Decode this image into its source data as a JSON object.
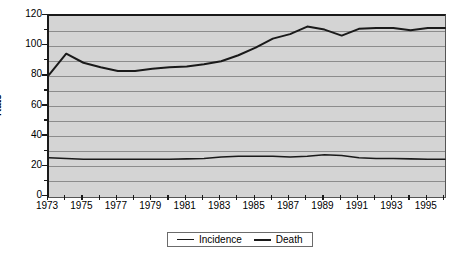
{
  "chart_data": {
    "type": "line",
    "title": "",
    "subtitle": "",
    "xlabel": "",
    "ylabel": "Rate",
    "ylim": [
      0,
      120
    ],
    "xlim": [
      1973,
      1996
    ],
    "ytick_labels": [
      "120",
      "100",
      "80",
      "60",
      "40",
      "20",
      "0"
    ],
    "ytick_values": [
      120,
      100,
      80,
      60,
      40,
      20,
      0
    ],
    "ytick_minor_step": 10,
    "grid": "horizontal",
    "legend_position": "bottom-center",
    "x": [
      1973,
      1974,
      1975,
      1976,
      1977,
      1978,
      1979,
      1980,
      1981,
      1982,
      1983,
      1984,
      1985,
      1986,
      1987,
      1988,
      1989,
      1990,
      1991,
      1992,
      1993,
      1994,
      1995,
      1996
    ],
    "xtick_labels": [
      "1973",
      "1975",
      "1977",
      "1979",
      "1981",
      "1983",
      "1985",
      "1987",
      "1989",
      "1991",
      "1993",
      "1995"
    ],
    "xtick_label_values": [
      1973,
      1975,
      1977,
      1979,
      1981,
      1983,
      1985,
      1987,
      1989,
      1991,
      1993,
      1995
    ],
    "series": [
      {
        "name": "Incidence",
        "line_style": "thin",
        "color": "#1a1a1a",
        "values": [
          26,
          25.5,
          25,
          25,
          25,
          25,
          25,
          25,
          25.3,
          25.5,
          26.5,
          27,
          27,
          27,
          26.5,
          27,
          28,
          27.5,
          26,
          25.5,
          25.5,
          25.3,
          25,
          25
        ]
      },
      {
        "name": "Death",
        "line_style": "thick",
        "color": "#1a1a1a",
        "values": [
          81,
          95,
          89,
          86,
          83.5,
          83.5,
          85,
          86,
          86.5,
          88,
          90,
          94,
          99,
          105,
          108,
          113,
          111,
          107,
          111.5,
          112,
          112,
          110.5,
          112,
          112
        ]
      }
    ]
  },
  "legend": {
    "items": [
      {
        "label": "Incidence",
        "style": "thin"
      },
      {
        "label": "Death",
        "style": "thick"
      }
    ]
  },
  "colors": {
    "plot_background": "#d4d4d4",
    "gridline": "#8c8c8c",
    "axis": "#1a1a1a",
    "page_background": "#ffffff"
  }
}
